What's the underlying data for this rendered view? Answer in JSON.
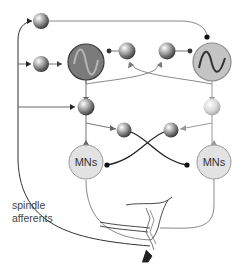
{
  "diagram": {
    "labels": {
      "mn_left": "MNs",
      "mn_right": "MNs",
      "afferents_line1": "spindle",
      "afferents_line2": "afferents"
    },
    "nodes": [
      {
        "id": "afferent-interneuron-top",
        "kind": "sphere"
      },
      {
        "id": "afferent-interneuron-left",
        "kind": "sphere"
      },
      {
        "id": "rhythm-generator-left",
        "kind": "oscillator",
        "shade": "dark"
      },
      {
        "id": "inhibitory-interneuron-left",
        "kind": "sphere"
      },
      {
        "id": "inhibitory-interneuron-right",
        "kind": "sphere"
      },
      {
        "id": "rhythm-generator-right",
        "kind": "oscillator",
        "shade": "light"
      },
      {
        "id": "pattern-interneuron-left",
        "kind": "sphere"
      },
      {
        "id": "pattern-interneuron-right",
        "kind": "sphere",
        "shade": "light"
      },
      {
        "id": "crossed-interneuron-left",
        "kind": "sphere"
      },
      {
        "id": "crossed-interneuron-right",
        "kind": "sphere"
      },
      {
        "id": "motoneurons-left",
        "kind": "pool"
      },
      {
        "id": "motoneurons-right",
        "kind": "pool"
      }
    ],
    "synapse_types": {
      "excitatory": "triangle",
      "inhibitory": "filled-dot"
    },
    "colors": {
      "line": "#777777",
      "dark_line": "#222222",
      "oscillator_dark": "#7a7a7a",
      "oscillator_light": "#c4c4c4",
      "mn_fill": "#e2e2e2"
    }
  }
}
